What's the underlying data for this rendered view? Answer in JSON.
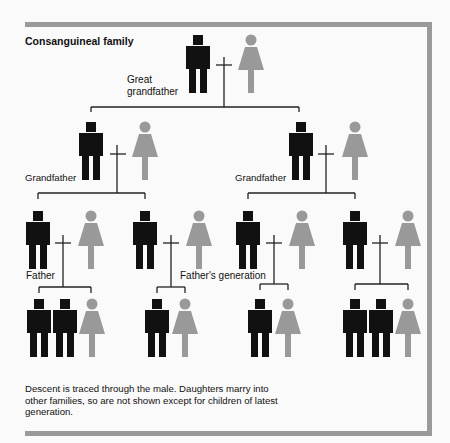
{
  "title": "Consanguineal family",
  "labels": {
    "great_grandfather_line1": "Great",
    "great_grandfather_line2": "grandfather",
    "grandfather_left": "Grandfather",
    "grandfather_right": "Grandfather",
    "father": "Father",
    "fathers_generation": "Father's generation"
  },
  "caption": "Descent is traced through the male. Daughters marry into other families, so are not shown except for children of latest generation.",
  "colors": {
    "male": "#111111",
    "female": "#999999",
    "frame": "#9a9a9a",
    "line": "#222222"
  },
  "legend": {
    "male_symbol": "black figure",
    "female_symbol": "gray figure",
    "marriage_symbol": "cross (+)"
  }
}
